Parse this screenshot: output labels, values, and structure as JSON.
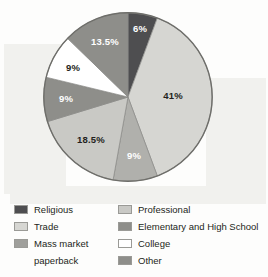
{
  "chart_data": {
    "type": "pie",
    "title": "",
    "categories": [
      "Religious",
      "Trade",
      "Mass market paperback",
      "Professional",
      "Elementary and High School",
      "College",
      "Other"
    ],
    "values": [
      6,
      41,
      9,
      18.5,
      9,
      9,
      13.5
    ],
    "value_labels": [
      "6%",
      "41%",
      "9%",
      "18.5%",
      "9%",
      "9%",
      "13.5%"
    ],
    "units": "percent",
    "total": 106,
    "start_angle_deg": 0,
    "direction": "clockwise",
    "legend_position": "bottom",
    "grid": false,
    "colors": {
      "religious": "#4e4e50",
      "trade": "#d6d6d2",
      "mass_market_paperback": "#b0b0ac",
      "professional": "#c9c9c5",
      "elementary_and_high_school": "#8e8e8a",
      "college": "#ffffff",
      "other": "#8e8e8a"
    },
    "slices": [
      {
        "label": "Religious",
        "value": 6,
        "value_label": "6%",
        "color": "#4e4e50",
        "label_color": "light",
        "label_x": 140,
        "label_y": 28
      },
      {
        "label": "Trade",
        "value": 41,
        "value_label": "41%",
        "color": "#d6d6d2",
        "label_color": "dark",
        "label_x": 173,
        "label_y": 95
      },
      {
        "label": "Mass market paperback",
        "value": 9,
        "value_label": "9%",
        "color": "#b0b0ac",
        "label_color": "light",
        "label_x": 134,
        "label_y": 155
      },
      {
        "label": "Professional",
        "value": 18.5,
        "value_label": "18.5%",
        "color": "#c9c9c5",
        "label_color": "dark",
        "label_x": 91,
        "label_y": 139
      },
      {
        "label": "Elementary and High School",
        "value": 9,
        "value_label": "9%",
        "color": "#8e8e8a",
        "label_color": "light",
        "label_x": 66,
        "label_y": 98
      },
      {
        "label": "College",
        "value": 9,
        "value_label": "9%",
        "color": "#ffffff",
        "label_color": "dark",
        "label_x": 73,
        "label_y": 67
      },
      {
        "label": "Other",
        "value": 13.5,
        "value_label": "13.5%",
        "color": "#8e8e8a",
        "label_color": "light",
        "label_x": 105,
        "label_y": 41
      }
    ]
  },
  "legend": {
    "left_column": [
      {
        "label": "Religious",
        "color": "#4e4e50",
        "has_swatch": true
      },
      {
        "label": "Trade",
        "color": "#d6d6d2",
        "has_swatch": true
      },
      {
        "label": "Mass market",
        "color": "#9f9f9b",
        "has_swatch": true
      },
      {
        "label": "paperback",
        "color": "",
        "has_swatch": false
      }
    ],
    "right_column": [
      {
        "label": "Professional",
        "color": "#c9c9c5",
        "has_swatch": true
      },
      {
        "label": "Elementary and High School",
        "color": "#8e8e8a",
        "has_swatch": true
      },
      {
        "label": "College",
        "color": "#ffffff",
        "has_swatch": true
      },
      {
        "label": "Other",
        "color": "#8e8e8a",
        "has_swatch": true
      }
    ]
  }
}
